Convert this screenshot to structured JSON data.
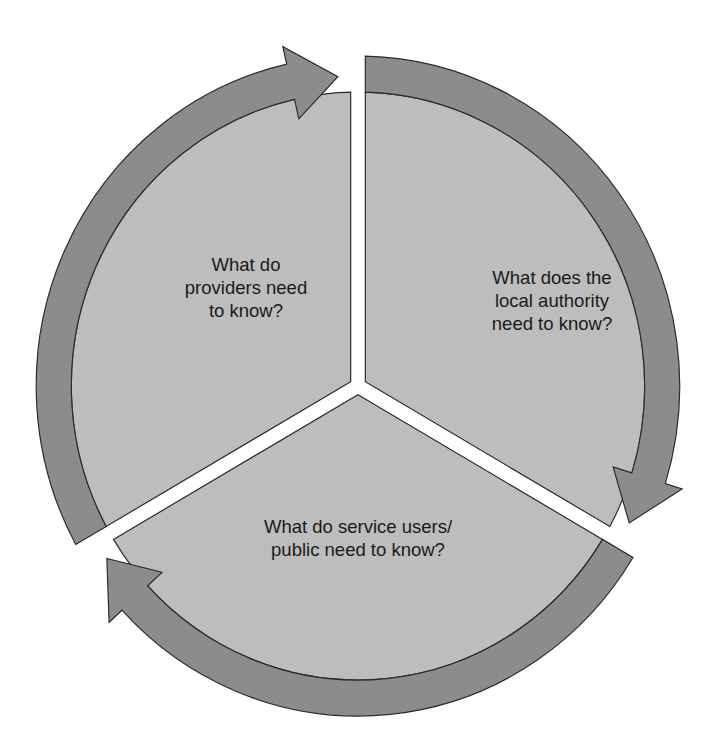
{
  "diagram": {
    "type": "cycle",
    "colors": {
      "ring": "#8c8c8c",
      "sector": "#bdbdbd",
      "outline": "#2a2a2a",
      "text": "#1a1a1a",
      "background": "#ffffff"
    },
    "segments": [
      {
        "id": "providers",
        "lines": [
          "What do",
          "providers need",
          "to know?"
        ]
      },
      {
        "id": "local-authority",
        "lines": [
          "What does the",
          "local authority",
          "need to know?"
        ]
      },
      {
        "id": "service-users",
        "lines": [
          "What do service users/",
          "public need to know?"
        ]
      }
    ],
    "flow": [
      "providers",
      "local-authority",
      "service-users",
      "providers"
    ]
  }
}
